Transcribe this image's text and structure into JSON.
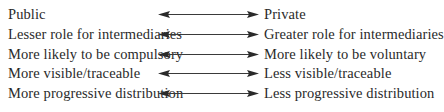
{
  "diagram": {
    "type": "bidirectional-spectrum",
    "arrow_color": "#3a3a3a",
    "rows": [
      {
        "left": "Public",
        "right": "Private"
      },
      {
        "left": "Lesser role for intermediaries",
        "right": "Greater role for intermediaries"
      },
      {
        "left": "More likely to be compulsory",
        "right": "More likely to be voluntary"
      },
      {
        "left": "More visible/traceable",
        "right": "Less visible/traceable"
      },
      {
        "left": "More progressive distribution",
        "right": "Less progressive distribution"
      }
    ]
  }
}
